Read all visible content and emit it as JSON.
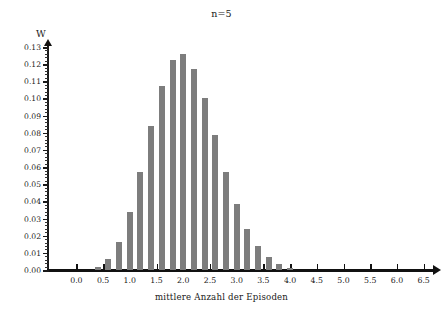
{
  "chart_data": {
    "type": "bar",
    "title": "n=5",
    "xlabel": "mittlere Anzahl der Episoden",
    "ylabel": "W",
    "xlim": [
      -0.55,
      6.75
    ],
    "ylim": [
      0.0,
      0.13
    ],
    "grid": false,
    "legend": null,
    "bar_color": "#7d7d7d",
    "axis_color": "#111111",
    "x": [
      0.4,
      0.6,
      0.8,
      1.0,
      1.2,
      1.4,
      1.6,
      1.8,
      2.0,
      2.2,
      2.4,
      2.6,
      2.8,
      3.0,
      3.2,
      3.4,
      3.6,
      3.8,
      4.0
    ],
    "values": [
      0.0016,
      0.0065,
      0.0163,
      0.0336,
      0.057,
      0.084,
      0.1075,
      0.1225,
      0.1258,
      0.1172,
      0.1001,
      0.0785,
      0.057,
      0.0383,
      0.0239,
      0.0139,
      0.0074,
      0.0036,
      0.0014
    ],
    "xticks": [
      {
        "value": 0.0,
        "label": "0.0"
      },
      {
        "value": 0.5,
        "label": "0.5"
      },
      {
        "value": 1.0,
        "label": "1.0"
      },
      {
        "value": 1.5,
        "label": "1.5"
      },
      {
        "value": 2.0,
        "label": "2.0"
      },
      {
        "value": 2.5,
        "label": "2.5"
      },
      {
        "value": 3.0,
        "label": "3.0"
      },
      {
        "value": 3.5,
        "label": "3.5"
      },
      {
        "value": 4.0,
        "label": "4.0"
      },
      {
        "value": 4.5,
        "label": "4.5"
      },
      {
        "value": 5.0,
        "label": "5.0"
      },
      {
        "value": 5.5,
        "label": "5.5"
      },
      {
        "value": 6.0,
        "label": "6.0"
      },
      {
        "value": 6.5,
        "label": "6.5"
      }
    ],
    "yticks": [
      {
        "value": 0.0,
        "label": "0.00"
      },
      {
        "value": 0.01,
        "label": "0.01"
      },
      {
        "value": 0.02,
        "label": "0.02"
      },
      {
        "value": 0.03,
        "label": "0.03"
      },
      {
        "value": 0.04,
        "label": "0.04"
      },
      {
        "value": 0.05,
        "label": "0.05"
      },
      {
        "value": 0.06,
        "label": "0.06"
      },
      {
        "value": 0.07,
        "label": "0.07"
      },
      {
        "value": 0.08,
        "label": "0.08"
      },
      {
        "value": 0.09,
        "label": "0.09"
      },
      {
        "value": 0.1,
        "label": "0.10"
      },
      {
        "value": 0.11,
        "label": "0.11"
      },
      {
        "value": 0.12,
        "label": "0.12"
      },
      {
        "value": 0.13,
        "label": "0.13"
      }
    ]
  }
}
